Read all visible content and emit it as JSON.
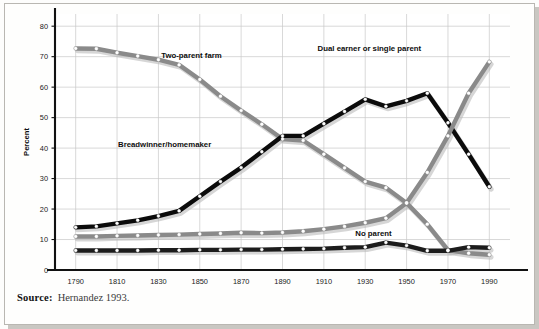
{
  "figure": {
    "source_label": "Source:",
    "source_text": "Hernandez 1993."
  },
  "chart_data": {
    "type": "line",
    "title": "",
    "subtitle": "",
    "xlabel": "",
    "ylabel": "Percent",
    "x": [
      1790,
      1800,
      1810,
      1820,
      1830,
      1840,
      1850,
      1860,
      1870,
      1880,
      1890,
      1900,
      1910,
      1920,
      1930,
      1940,
      1950,
      1960,
      1970,
      1980,
      1990
    ],
    "xticks": [
      1790,
      1810,
      1830,
      1850,
      1870,
      1890,
      1910,
      1930,
      1950,
      1970,
      1990
    ],
    "yticks": [
      0,
      10,
      20,
      30,
      40,
      50,
      60,
      70,
      80
    ],
    "xlim": [
      1780,
      2000
    ],
    "ylim": [
      0,
      84
    ],
    "grid": true,
    "legend": "inline-annotations",
    "series": [
      {
        "name": "Two-parent farm",
        "color": "#8a8a8a",
        "label_x": 1846,
        "label_y": 69.5,
        "values": [
          72.7,
          72.6,
          71.3,
          70.2,
          69.0,
          67.3,
          62.5,
          57.0,
          52.3,
          47.8,
          43.0,
          42.5,
          38.0,
          33.5,
          29.0,
          27.0,
          22.0,
          15.0,
          6.5,
          5.5,
          5.0
        ]
      },
      {
        "name": "Breadwinner/homemaker",
        "color": "#0b0b0b",
        "label_x": 1833,
        "label_y": 40.5,
        "values": [
          14.0,
          14.3,
          15.3,
          16.3,
          17.7,
          19.4,
          24.2,
          29.0,
          33.6,
          38.8,
          44.0,
          44.0,
          48.0,
          52.0,
          56.0,
          53.7,
          55.5,
          58.0,
          48.3,
          38.0,
          27.3
        ]
      },
      {
        "name": "Dual earner or single parent",
        "color": "#8a8a8a",
        "label_x": 1932,
        "label_y": 72.0,
        "values": [
          11.0,
          11.0,
          11.2,
          11.3,
          11.5,
          11.6,
          11.8,
          12.0,
          12.2,
          12.1,
          12.3,
          12.7,
          13.4,
          14.3,
          15.5,
          17.0,
          22.0,
          32.0,
          44.0,
          58.0,
          68.3
        ]
      },
      {
        "name": "No parent",
        "color": "#1c1c1c",
        "label_x": 1934,
        "label_y": 11.0,
        "values": [
          6.4,
          6.4,
          6.4,
          6.4,
          6.5,
          6.5,
          6.6,
          6.6,
          6.7,
          6.7,
          6.8,
          6.9,
          7.0,
          7.3,
          7.5,
          9.0,
          8.0,
          6.3,
          6.3,
          7.5,
          7.3
        ]
      }
    ]
  }
}
